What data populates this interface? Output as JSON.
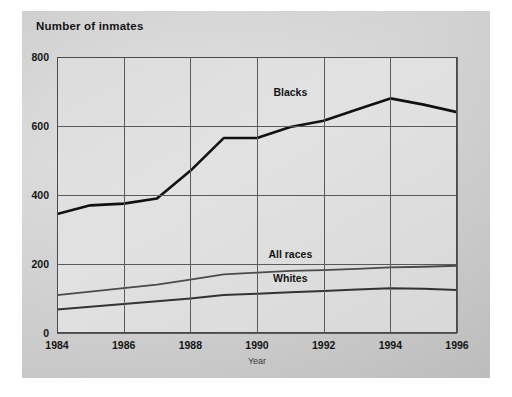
{
  "chart_data": {
    "type": "line",
    "title": "Number of inmates",
    "xlabel": "Year",
    "ylabel": "",
    "x": [
      1984,
      1985,
      1986,
      1987,
      1988,
      1989,
      1990,
      1991,
      1992,
      1993,
      1994,
      1995,
      1996
    ],
    "xlim": [
      1984,
      1996
    ],
    "ylim": [
      0,
      800
    ],
    "xticks": [
      "1984",
      "1986",
      "1988",
      "1990",
      "1992",
      "1994",
      "1996"
    ],
    "yticks": [
      "0",
      "200",
      "400",
      "600",
      "800"
    ],
    "grid": "both",
    "legend": "inline-annotations",
    "series": [
      {
        "name": "Blacks",
        "label_x": 1991.0,
        "label_y": 700,
        "color": "#111111",
        "values": [
          345,
          370,
          375,
          390,
          470,
          565,
          565,
          597,
          615,
          648,
          680,
          662,
          640
        ]
      },
      {
        "name": "All races",
        "label_x": 1991.0,
        "label_y": 228,
        "color": "#4a4a4a",
        "values": [
          110,
          120,
          130,
          140,
          155,
          170,
          175,
          180,
          182,
          186,
          190,
          192,
          195
        ]
      },
      {
        "name": "Whites",
        "label_x": 1991.0,
        "label_y": 160,
        "color": "#333333",
        "values": [
          68,
          76,
          84,
          92,
          100,
          110,
          114,
          118,
          122,
          126,
          130,
          128,
          125
        ]
      }
    ]
  }
}
